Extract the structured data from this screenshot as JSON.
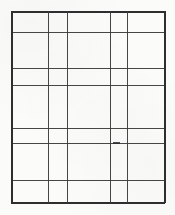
{
  "document": {
    "kind": "blank-table-grid",
    "description": "Scanned blank table: 5 columns by 7 rows of empty cells",
    "background_color": "#fbfbfa",
    "line_color": "#3a3a3a",
    "frame_color": "#2e2e2e",
    "width": 175,
    "height": 215
  },
  "grid": {
    "column_count": 5,
    "row_count": 7,
    "vertical_line_positions": [
      11,
      48,
      67,
      110,
      127,
      164
    ],
    "horizontal_line_positions": [
      11,
      32,
      68,
      85,
      128,
      143,
      180,
      202
    ],
    "column_widths": [
      37,
      19,
      43,
      17,
      37
    ],
    "row_heights": [
      21,
      36,
      17,
      43,
      15,
      37,
      22
    ],
    "cells_are_empty": true,
    "cell_text": [
      [
        "",
        "",
        "",
        "",
        ""
      ],
      [
        "",
        "",
        "",
        "",
        ""
      ],
      [
        "",
        "",
        "",
        "",
        ""
      ],
      [
        "",
        "",
        "",
        "",
        ""
      ],
      [
        "",
        "",
        "",
        "",
        ""
      ],
      [
        "",
        "",
        "",
        "",
        ""
      ],
      [
        "",
        "",
        "",
        "",
        ""
      ]
    ]
  },
  "artifacts": {
    "blot": {
      "x": 113,
      "y": 142,
      "width": 7,
      "height": 2
    }
  }
}
